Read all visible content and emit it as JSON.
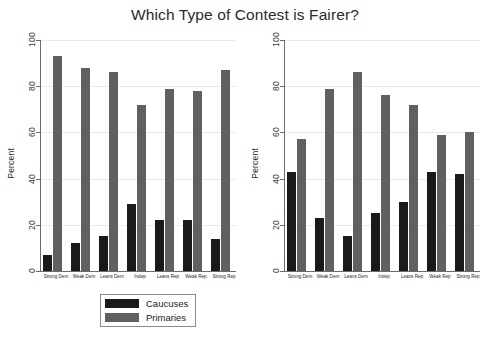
{
  "title": "Which Type of Contest is Fairer?",
  "chart_data": [
    {
      "type": "bar",
      "panel": "left",
      "title": "Which Type of Contest is Fairer?",
      "xlabel": "",
      "ylabel": "Percent",
      "ylim": [
        0,
        100
      ],
      "yticks": [
        0,
        20,
        40,
        60,
        80,
        100
      ],
      "grid": true,
      "legend_position": "bottom-center",
      "categories": [
        "Strong Dem",
        "Weak Dem",
        "Leans Dem",
        "Indep",
        "Leans Rep",
        "Weak Rep",
        "Strong Rep"
      ],
      "series": [
        {
          "name": "Caucuses",
          "color": "#1a1a1a",
          "values": [
            7,
            12,
            15,
            29,
            22,
            22,
            14
          ]
        },
        {
          "name": "Primaries",
          "color": "#606060",
          "values": [
            93,
            88,
            86,
            72,
            79,
            78,
            87
          ]
        }
      ]
    },
    {
      "type": "bar",
      "panel": "right",
      "title": "",
      "xlabel": "",
      "ylabel": "Percent",
      "ylim": [
        0,
        100
      ],
      "yticks": [
        0,
        20,
        40,
        60,
        80,
        100
      ],
      "grid": true,
      "legend_position": "bottom-center",
      "categories": [
        "Strong Dem",
        "Weak Dem",
        "Leans Dem",
        "Indep",
        "Leans Rep",
        "Weak Rep",
        "Strong Rep"
      ],
      "series": [
        {
          "name": "Closed Contests",
          "color": "#1a1a1a",
          "values": [
            43,
            23,
            15,
            25,
            30,
            43,
            42
          ]
        },
        {
          "name": "Open Contests",
          "color": "#606060",
          "values": [
            57,
            79,
            86,
            76,
            72,
            59,
            60
          ]
        }
      ]
    }
  ]
}
